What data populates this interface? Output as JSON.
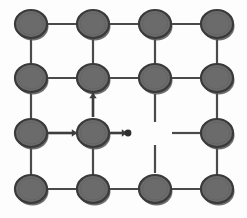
{
  "figure": {
    "type": "node-link-diagram",
    "width": 247,
    "height": 218,
    "background_color": "#fdfdfd"
  },
  "style": {
    "node_fill": "#6b6b6b",
    "node_stroke": "#3a3a3a",
    "node_radius": 16,
    "node_ry": 14,
    "edge_color": "#4a4a4a",
    "edge_width": 2.2,
    "arrow_color": "#3d3d3d",
    "shadow_color": "#555555"
  },
  "grid": {
    "columns": [
      31,
      93,
      155,
      217
    ],
    "rows": [
      24,
      78,
      133,
      189
    ],
    "column_count": 4,
    "row_count": 4
  },
  "nodes": [
    {
      "id": "n00",
      "row": 0,
      "col": 0,
      "cx": 31,
      "cy": 24,
      "label": ""
    },
    {
      "id": "n01",
      "row": 0,
      "col": 1,
      "cx": 93,
      "cy": 24,
      "label": ""
    },
    {
      "id": "n02",
      "row": 0,
      "col": 2,
      "cx": 155,
      "cy": 24,
      "label": ""
    },
    {
      "id": "n03",
      "row": 0,
      "col": 3,
      "cx": 217,
      "cy": 24,
      "label": ""
    },
    {
      "id": "n10",
      "row": 1,
      "col": 0,
      "cx": 31,
      "cy": 78,
      "label": ""
    },
    {
      "id": "n11",
      "row": 1,
      "col": 1,
      "cx": 93,
      "cy": 78,
      "label": ""
    },
    {
      "id": "n12",
      "row": 1,
      "col": 2,
      "cx": 155,
      "cy": 78,
      "label": ""
    },
    {
      "id": "n13",
      "row": 1,
      "col": 3,
      "cx": 217,
      "cy": 78,
      "label": ""
    },
    {
      "id": "n20",
      "row": 2,
      "col": 0,
      "cx": 31,
      "cy": 133,
      "label": ""
    },
    {
      "id": "n21",
      "row": 2,
      "col": 1,
      "cx": 93,
      "cy": 133,
      "label": ""
    },
    {
      "id": "n23",
      "row": 2,
      "col": 3,
      "cx": 217,
      "cy": 133,
      "label": ""
    },
    {
      "id": "n30",
      "row": 3,
      "col": 0,
      "cx": 31,
      "cy": 189,
      "label": ""
    },
    {
      "id": "n31",
      "row": 3,
      "col": 1,
      "cx": 93,
      "cy": 189,
      "label": ""
    },
    {
      "id": "n32",
      "row": 3,
      "col": 2,
      "cx": 155,
      "cy": 189,
      "label": ""
    },
    {
      "id": "n33",
      "row": 3,
      "col": 3,
      "cx": 217,
      "cy": 189,
      "label": ""
    }
  ],
  "edges": [
    {
      "id": "e-n00-n01",
      "from": "n00",
      "to": "n01",
      "x1": 31,
      "y1": 24,
      "x2": 93,
      "y2": 24
    },
    {
      "id": "e-n01-n02",
      "from": "n01",
      "to": "n02",
      "x1": 93,
      "y1": 24,
      "x2": 155,
      "y2": 24
    },
    {
      "id": "e-n02-n03",
      "from": "n02",
      "to": "n03",
      "x1": 155,
      "y1": 24,
      "x2": 217,
      "y2": 24
    },
    {
      "id": "e-n10-n11",
      "from": "n10",
      "to": "n11",
      "x1": 31,
      "y1": 78,
      "x2": 93,
      "y2": 78
    },
    {
      "id": "e-n11-n12",
      "from": "n11",
      "to": "n12",
      "x1": 93,
      "y1": 78,
      "x2": 155,
      "y2": 78
    },
    {
      "id": "e-n12-n13",
      "from": "n12",
      "to": "n13",
      "x1": 155,
      "y1": 78,
      "x2": 217,
      "y2": 78
    },
    {
      "id": "e-n20-n21",
      "from": "n20",
      "to": "n21",
      "x1": 31,
      "y1": 133,
      "x2": 93,
      "y2": 133
    },
    {
      "id": "e-n30-n31",
      "from": "n30",
      "to": "n31",
      "x1": 31,
      "y1": 189,
      "x2": 93,
      "y2": 189
    },
    {
      "id": "e-n31-n32",
      "from": "n31",
      "to": "n32",
      "x1": 93,
      "y1": 189,
      "x2": 155,
      "y2": 189
    },
    {
      "id": "e-n32-n33",
      "from": "n32",
      "to": "n33",
      "x1": 155,
      "y1": 189,
      "x2": 217,
      "y2": 189
    },
    {
      "id": "e-n00-n10",
      "from": "n00",
      "to": "n10",
      "x1": 31,
      "y1": 24,
      "x2": 31,
      "y2": 78
    },
    {
      "id": "e-n01-n11",
      "from": "n01",
      "to": "n11",
      "x1": 93,
      "y1": 24,
      "x2": 93,
      "y2": 78
    },
    {
      "id": "e-n02-n12",
      "from": "n02",
      "to": "n12",
      "x1": 155,
      "y1": 24,
      "x2": 155,
      "y2": 78
    },
    {
      "id": "e-n03-n13",
      "from": "n03",
      "to": "n13",
      "x1": 217,
      "y1": 24,
      "x2": 217,
      "y2": 78
    },
    {
      "id": "e-n10-n20",
      "from": "n10",
      "to": "n20",
      "x1": 31,
      "y1": 78,
      "x2": 31,
      "y2": 133
    },
    {
      "id": "e-n13-n23",
      "from": "n13",
      "to": "n23",
      "x1": 217,
      "y1": 78,
      "x2": 217,
      "y2": 133
    },
    {
      "id": "e-n20-n30",
      "from": "n20",
      "to": "n30",
      "x1": 31,
      "y1": 133,
      "x2": 31,
      "y2": 189
    },
    {
      "id": "e-n21-n31",
      "from": "n21",
      "to": "n31",
      "x1": 93,
      "y1": 133,
      "x2": 93,
      "y2": 189
    },
    {
      "id": "e-n23-n33",
      "from": "n23",
      "to": "n33",
      "x1": 217,
      "y1": 133,
      "x2": 217,
      "y2": 189
    }
  ],
  "stubs": [
    {
      "id": "stub-down-from-n12",
      "orientation": "vertical",
      "x1": 155,
      "y1": 94,
      "x2": 155,
      "y2": 122
    },
    {
      "id": "stub-up-from-n32",
      "orientation": "vertical",
      "x1": 155,
      "y1": 145,
      "x2": 155,
      "y2": 173
    },
    {
      "id": "stub-left-from-n23",
      "orientation": "horizontal",
      "x1": 172,
      "y1": 133,
      "x2": 201,
      "y2": 133
    }
  ],
  "arrows": [
    {
      "id": "arrow-n20-to-n21",
      "direction": "right",
      "from": "n20",
      "to": "n21",
      "x1": 47,
      "y1": 133,
      "x2": 77,
      "y2": 133,
      "head_x": 77,
      "head_y": 133
    },
    {
      "id": "arrow-n21-up",
      "direction": "up",
      "from": "n21",
      "to": "n11",
      "x1": 93,
      "y1": 117,
      "x2": 93,
      "y2": 93,
      "head_x": 93,
      "head_y": 93
    },
    {
      "id": "arrow-n21-right-terminal",
      "direction": "right",
      "from": "n21",
      "to": "terminal-dot",
      "x1": 109,
      "y1": 133,
      "x2": 127,
      "y2": 133,
      "head_x": 127,
      "head_y": 133
    }
  ],
  "terminals": [
    {
      "id": "terminal-dot-right-of-n21",
      "cx": 128,
      "cy": 133,
      "r": 3.4
    }
  ]
}
